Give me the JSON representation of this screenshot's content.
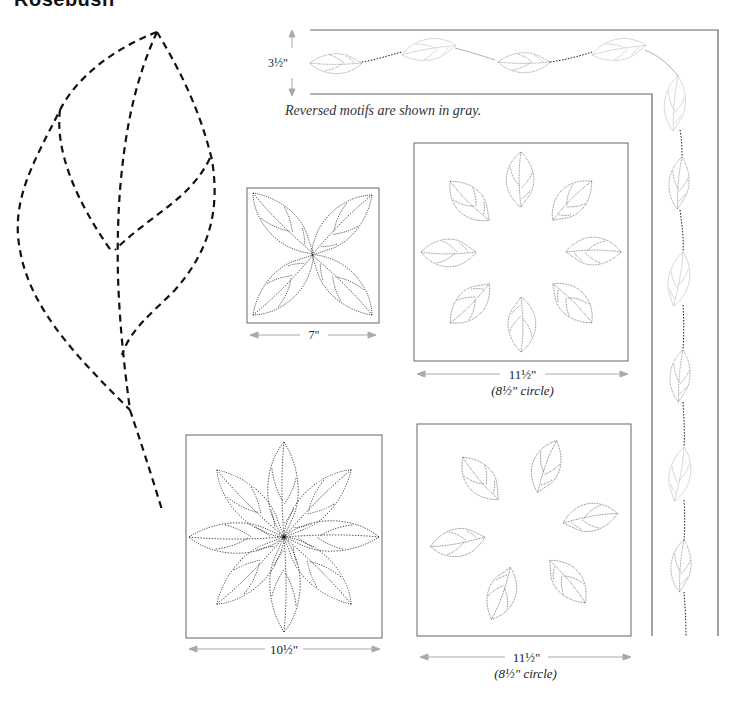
{
  "page": {
    "title": "Rosebush",
    "note": "Reversed motifs are shown in gray."
  },
  "motifs": {
    "full_size_leaf": {
      "label": "Full-size leaf motif"
    },
    "border": {
      "height_label": "3½\""
    },
    "block_pinwheel": {
      "width_label": "7\""
    },
    "wreath_top": {
      "width_label": "11½\"",
      "sub_label": "(8½\" circle)"
    },
    "block_star": {
      "width_label": "10½\""
    },
    "wreath_bottom": {
      "width_label": "11½\"",
      "sub_label": "(8½\" circle)"
    }
  },
  "colors": {
    "stitch": "#1a1a1a",
    "reversed": "#b0b0b0",
    "frame": "#555555",
    "dimension_arrow": "#aaaaaa"
  }
}
